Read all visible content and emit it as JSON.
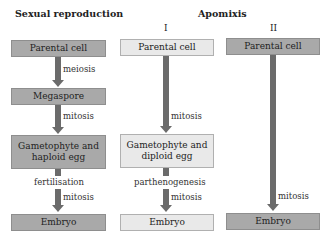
{
  "titles": {
    "sexual": "Sexual reproduction",
    "apomixis": "Apomixis",
    "col2_roman": "I",
    "col3_roman": "II"
  },
  "sexual": {
    "boxes": [
      "Parental cell",
      "Megaspore",
      "Gametophyte and haploid egg",
      "Embryo"
    ],
    "labels": {
      "step1": "meiosis",
      "step2": "mitosis",
      "step3a": "fertilisation",
      "step3b": "mitosis"
    }
  },
  "apomixis_1": {
    "boxes": [
      "Parental cell",
      "Gametophyte and diploid egg",
      "Embryo"
    ],
    "labels": {
      "step1": "mitosis",
      "step2a": "parthenogenesis",
      "step2b": "mitosis"
    }
  },
  "apomixis_2": {
    "boxes": [
      "Parental cell",
      "Embryo"
    ],
    "labels": {
      "step1": "mitosis"
    }
  },
  "colors": {
    "dark_box": "#a9a9a9",
    "light_box": "#e9e9e9",
    "arrow": "#6b6b6b"
  }
}
